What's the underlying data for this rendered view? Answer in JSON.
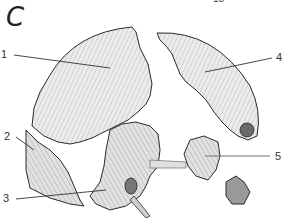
{
  "figure": {
    "panel_letter": "C",
    "top_number": "18",
    "labels": [
      {
        "id": "1",
        "text": "1"
      },
      {
        "id": "2",
        "text": "2"
      },
      {
        "id": "3",
        "text": "3"
      },
      {
        "id": "4",
        "text": "4"
      },
      {
        "id": "5",
        "text": "5"
      }
    ],
    "colors": {
      "bone_fill": "#e6e6e6",
      "outline": "#2a2a2a",
      "hatch": "#9a9a9a",
      "leader": "#333333"
    }
  }
}
